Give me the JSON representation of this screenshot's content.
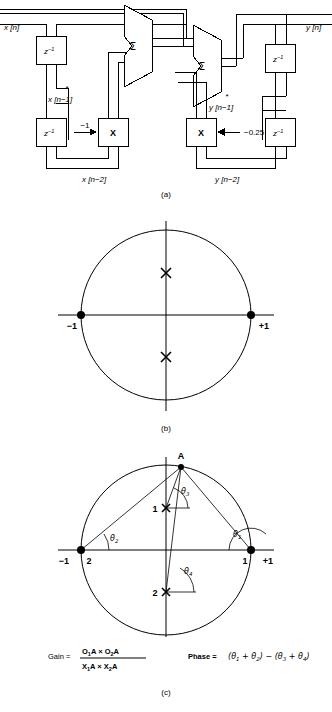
{
  "figure": {
    "title_caption_a": "(a)",
    "title_caption_b": "(b)",
    "title_caption_c": "(c)"
  },
  "block_diagram": {
    "input_label": "x [n]",
    "output_label": "y [n]",
    "delay_label": "z",
    "delay_exponent": "−1",
    "adder_symbol": "Σ",
    "multiplier_symbol": "X",
    "left_section": {
      "tap1_label": "x [n−1]",
      "tap1_star": "*",
      "tap2_label": "x [n−2]",
      "coefficient": "−1"
    },
    "right_section": {
      "tap1_label": "y [n−1]",
      "tap1_star": "*",
      "tap2_label": "y [n−2]",
      "coefficient": "−0.25"
    }
  },
  "pole_zero_plot": {
    "caption": "(b)",
    "axis_left_label": "−1",
    "axis_right_label": "+1",
    "zeros": [
      {
        "name": "zero-minus-one",
        "re": -1.0,
        "im": 0.0,
        "marker": "dot"
      },
      {
        "name": "zero-plus-one",
        "re": 1.0,
        "im": 0.0,
        "marker": "dot"
      }
    ],
    "poles": [
      {
        "name": "pole-upper",
        "re": 0.0,
        "im": 0.5,
        "marker": "cross"
      },
      {
        "name": "pole-lower",
        "re": 0.0,
        "im": -0.5,
        "marker": "cross"
      }
    ],
    "unit_circle_radius": 1.0
  },
  "geometric_plot": {
    "caption": "(c)",
    "point_a_label": "A",
    "axis_left_label": "−1",
    "axis_right_label": "+1",
    "zero1_label": "1",
    "zero2_label": "2",
    "pole1_label": "1",
    "pole2_label": "2",
    "angles": [
      {
        "id": "theta1",
        "symbol": "θ",
        "sub": "1",
        "at": "zero-plus-one"
      },
      {
        "id": "theta2",
        "symbol": "θ",
        "sub": "2",
        "at": "zero-minus-one"
      },
      {
        "id": "theta3",
        "symbol": "θ",
        "sub": "3",
        "at": "pole-upper"
      },
      {
        "id": "theta4",
        "symbol": "θ",
        "sub": "4",
        "at": "pole-lower"
      }
    ],
    "gain_formula": {
      "label": "Gain =",
      "numerator": "O₁A × O₂A",
      "denominator": "X₁A × X₂A",
      "num_t1": "O",
      "num_s1": "1",
      "num_a1": "A",
      "num_op": "×",
      "num_t2": "O",
      "num_s2": "2",
      "num_a2": "A",
      "den_t1": "X",
      "den_s1": "1",
      "den_a1": "A",
      "den_op": "×",
      "den_t2": "X",
      "den_s2": "2",
      "den_a2": "A"
    },
    "phase_formula": {
      "label": "Phase =",
      "expression": "(θ₁ + θ₂) − (θ₃ + θ₄)",
      "open1": "(",
      "t1": "θ",
      "s1": "1",
      "plus1": "+",
      "t2": "θ",
      "s2": "2",
      "close1": ")",
      "minus": "−",
      "open2": "(",
      "t3": "θ",
      "s3": "3",
      "plus2": "+",
      "t4": "θ",
      "s4": "4",
      "close2": ")"
    },
    "point_a": {
      "re": 0.18,
      "im": 0.98
    }
  },
  "colors": {
    "line": "#000000",
    "background": "#ffffff"
  }
}
